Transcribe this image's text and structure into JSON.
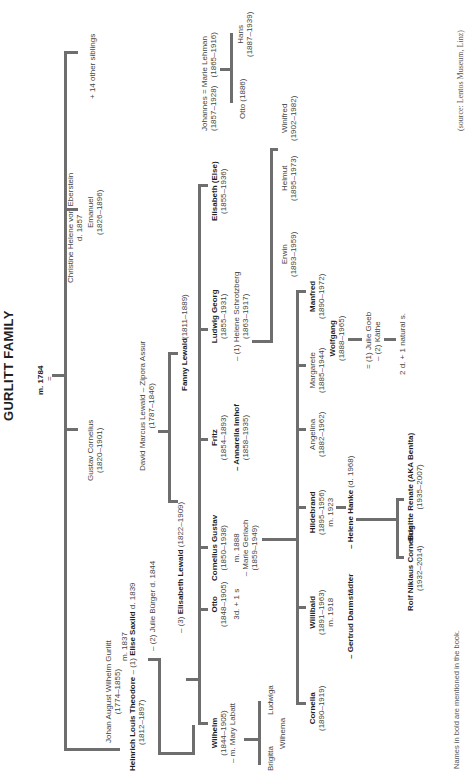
{
  "title": "GURLITT FAMILY",
  "marriage_1784": "m. 1784",
  "eq": "=",
  "people": {
    "johan": {
      "name": "Johan August Wilhelm Gurlitt",
      "dates": "(1774–1855)"
    },
    "christine": {
      "name": "Christine Helene von Eberstein",
      "dates": "d. 1857"
    },
    "heinrich": {
      "name": "Heinrich Louis Theodore",
      "dates": "(1812–1897)",
      "m": "m. 1837",
      "wife1_prefix": "– (1)",
      "wife1": "Elise Saxild",
      "wife1_d": "d. 1839",
      "wife2": "– (2) Julie Bürger d. 1844",
      "wife3_prefix": "– (3)",
      "wife3": "Elisabeth Lewald",
      "wife3_dates": "(1822–1909)"
    },
    "gustav": {
      "name": "Gustav Cornelius",
      "dates": "(1820–1901)"
    },
    "emanuel": {
      "name": "Emanuel",
      "dates": "(1826–1896)"
    },
    "others": {
      "name": "+ 14 other siblings"
    },
    "david": {
      "name": "David Marcus Lewald – Zipora Assur",
      "dates": "(1787–1846)"
    },
    "fanny": {
      "name": "Fanny Lewald",
      "dates": "(1811–1889)"
    },
    "wilhelm": {
      "name": "Wilhelm",
      "dates": "(1844–1905)",
      "spouse": "– m. Mary Labatt"
    },
    "brigitta": {
      "name": "Brigitta"
    },
    "wilhema": {
      "name": "Wilhema"
    },
    "ludwiga": {
      "name": "Ludwiga"
    },
    "otto": {
      "name": "Otto",
      "dates": "(1848–1905)",
      "kids": "3d. + 1 s"
    },
    "cornelius_gustav": {
      "name": "Cornelius Gustav",
      "dates": "(1850–1938)",
      "m": "m. 1888",
      "spouse": "– Marie Gerlach",
      "spouse_dates": "(1859–1949)"
    },
    "fritz": {
      "name": "Fritz",
      "dates": "(1854–1893)",
      "spouse": "– Annarella Imhof",
      "spouse_dates": "(1858–1935)"
    },
    "ludwig": {
      "name": "Ludwig Georg",
      "dates": "(1855–1931)",
      "spouse": "– (1) Helene Schrotzberg",
      "spouse_dates": "(1863–1917)"
    },
    "elisabeth_else": {
      "name": "Elisabeth (Else)",
      "dates": "(1855–1936)"
    },
    "johannes": {
      "name": "Johannes",
      "dates": "(1857–1928)",
      "eq": "=",
      "spouse": "Marie Lehman",
      "spouse_dates": "(1865–1916)"
    },
    "otto_1886": {
      "name": "Otto (1886)"
    },
    "hans": {
      "name": "Hans",
      "dates": "(1887–1939)"
    },
    "erwin": {
      "name": "Erwin",
      "dates": "(1893–1959)"
    },
    "helmut": {
      "name": "Helmut",
      "dates": "(1895–1973)"
    },
    "winifred": {
      "name": "Winifred",
      "dates": "(1902–1982)"
    },
    "cornelia": {
      "name": "Cornelia",
      "dates": "(1890–1919)"
    },
    "willibald": {
      "name": "Willibald",
      "dates": "(1891–1963)",
      "m": "m. 1918",
      "spouse": "– Gertrud Darmstädter"
    },
    "hildebrand": {
      "name": "Hildebrand",
      "dates": "(1895–1956)",
      "m": "m. 1923",
      "spouse": "– Helene Hanke",
      "spouse_d": "(d. 1968)"
    },
    "angelina": {
      "name": "Angelina",
      "dates": "(1882–1962)"
    },
    "margarete": {
      "name": "Margarete",
      "dates": "(1885–1944)"
    },
    "wolfgang": {
      "name": "Wolfgang",
      "dates": "(1888–1965)",
      "spouse1": "= (1) Julie Goeb",
      "spouse2": "– (2) Käthe",
      "kids": "2 d. + 1 natural s."
    },
    "manfred": {
      "name": "Manfred",
      "dates": "(1890–1972)"
    },
    "rolf": {
      "name": "Rolf Niklaus Cornelius",
      "dates": "(1932–2014)"
    },
    "brigitte": {
      "name": "Brigitte Renate (AKA Benita)",
      "dates": "(1935–2007)"
    }
  },
  "footnote": "Names in bold are mentioned in the book.",
  "source": "(source: Lentos Museum, Linz)",
  "colors": {
    "line": "#6e6e6e",
    "text": "#444444",
    "bold_text": "#1f1f1f",
    "background": "#ffffff"
  }
}
